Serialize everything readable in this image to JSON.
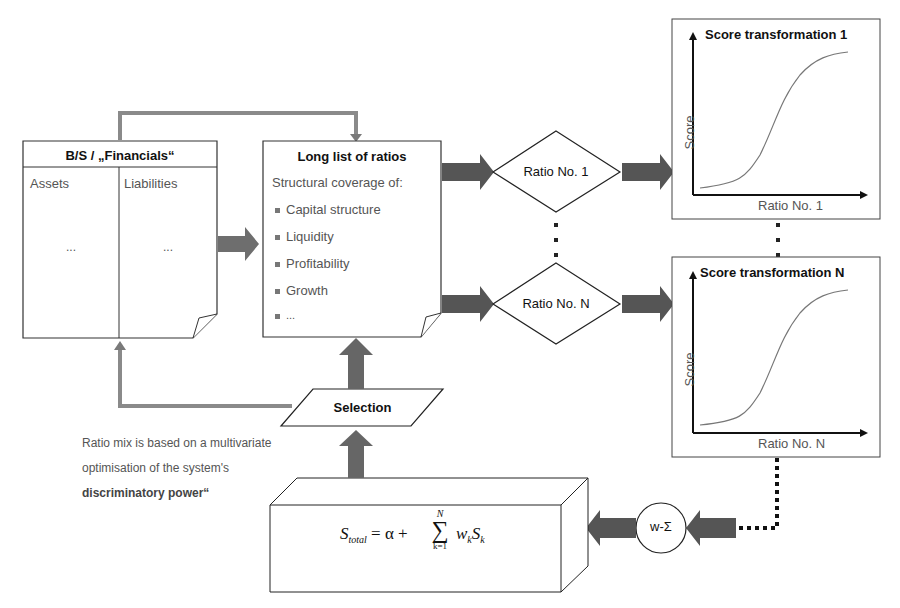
{
  "financials": {
    "title": "B/S / „Financials“",
    "columns": [
      {
        "label": "Assets",
        "placeholder": "..."
      },
      {
        "label": "Liabilities",
        "placeholder": "..."
      }
    ]
  },
  "ratios_list": {
    "title": "Long list of ratios",
    "subtitle": "Structural coverage of:",
    "items": [
      "Capital structure",
      "Liquidity",
      "Profitability",
      "Growth",
      "..."
    ]
  },
  "ratio_nodes": [
    {
      "label": "Ratio No. 1"
    },
    {
      "label": "Ratio No. N"
    }
  ],
  "score_charts": [
    {
      "title": "Score transformation 1",
      "ylabel": "Score",
      "xlabel": "Ratio No. 1"
    },
    {
      "title": "Score transformation N",
      "ylabel": "Score",
      "xlabel": "Ratio No. N"
    }
  ],
  "selection": {
    "label": "Selection"
  },
  "note": {
    "line1": "Ratio mix is based on a multivariate",
    "line2": "optimisation of the system's",
    "line3": "discriminatory power“"
  },
  "aggregator": {
    "label": "w-Σ"
  },
  "formula": {
    "lhs": "S",
    "lhs_sub": "total",
    "rhs_alpha": "= α +",
    "sum_symbol": "∑",
    "sum_upper": "N",
    "sum_lower": "k=1",
    "term": "w",
    "term_sub1": "k",
    "term2": "S",
    "term_sub2": "k"
  },
  "colors": {
    "arrow": "#6e6e6e",
    "arrow_dark": "#555555",
    "line": "#333333",
    "connector": "#8a8a8a"
  }
}
